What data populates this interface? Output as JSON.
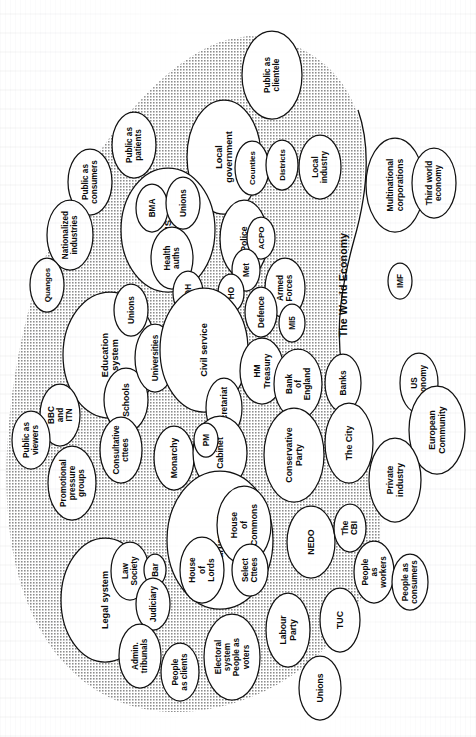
{
  "diagram": {
    "orientation": "page rotated 90 degrees; all labels read bottom-to-top",
    "colors": {
      "page_background": "#ffffff",
      "blob_fill": "#c9c9c9",
      "node_fill": "#ffffff",
      "stroke": "#111111",
      "text": "#0a0a0a"
    },
    "outer_region_label": "The World Economy",
    "nodes": [
      {
        "id": "public-as-clientele",
        "label": "Public as\nclientele",
        "cx": 272,
        "cy": 75,
        "rx": 30,
        "ry": 44,
        "fs": 8.2
      },
      {
        "id": "local-government",
        "label": "Local\ngovernment",
        "cx": 224,
        "cy": 157,
        "rx": 37,
        "ry": 57,
        "fs": 9.0
      },
      {
        "id": "counties",
        "label": "Counties",
        "cx": 252,
        "cy": 168,
        "rx": 17,
        "ry": 27,
        "fs": 7.9
      },
      {
        "id": "districts",
        "label": "Districts",
        "cx": 282,
        "cy": 165,
        "rx": 16,
        "ry": 25,
        "fs": 7.9
      },
      {
        "id": "local-industry",
        "label": "Local\nindustry",
        "cx": 320,
        "cy": 167,
        "rx": 21,
        "ry": 32,
        "fs": 8.2
      },
      {
        "id": "multinational-corporations",
        "label": "Multinational\ncorporations",
        "cx": 395,
        "cy": 185,
        "rx": 29,
        "ry": 47,
        "fs": 8.6
      },
      {
        "id": "third-world-economy",
        "label": "Third world\neconomy",
        "cx": 434,
        "cy": 183,
        "rx": 22,
        "ry": 35,
        "fs": 8.2
      },
      {
        "id": "public-as-patients",
        "label": "Public as\npatients",
        "cx": 134,
        "cy": 145,
        "rx": 22,
        "ry": 33,
        "fs": 8.2
      },
      {
        "id": "public-as-consumers-top",
        "label": "Public as\nconsumers",
        "cx": 90,
        "cy": 182,
        "rx": 22,
        "ry": 33,
        "fs": 8.2
      },
      {
        "id": "nationalized-industries",
        "label": "Nationalized\nindustries",
        "cx": 70,
        "cy": 235,
        "rx": 23,
        "ry": 35,
        "fs": 8.2
      },
      {
        "id": "quangos",
        "label": "Quangos",
        "cx": 47,
        "cy": 285,
        "rx": 17,
        "ry": 27,
        "fs": 8.0
      },
      {
        "id": "nhs",
        "label": "NHS",
        "cx": 168,
        "cy": 230,
        "rx": 47,
        "ry": 62,
        "fs": 9.5
      },
      {
        "id": "bma",
        "label": "BMA",
        "cx": 152,
        "cy": 208,
        "rx": 16,
        "ry": 24,
        "fs": 8.2
      },
      {
        "id": "unions-nhs",
        "label": "Unions",
        "cx": 183,
        "cy": 203,
        "rx": 17,
        "ry": 26,
        "fs": 8.2
      },
      {
        "id": "health-auths",
        "label": "Health\nauths",
        "cx": 172,
        "cy": 258,
        "rx": 21,
        "ry": 31,
        "fs": 8.2
      },
      {
        "id": "doh",
        "label": "DOH",
        "cx": 188,
        "cy": 293,
        "rx": 15,
        "ry": 22,
        "fs": 8.2
      },
      {
        "id": "police",
        "label": "Police",
        "cx": 244,
        "cy": 239,
        "rx": 24,
        "ry": 39,
        "fs": 8.6
      },
      {
        "id": "acpo",
        "label": "ACPO",
        "cx": 261,
        "cy": 238,
        "rx": 14,
        "ry": 21,
        "fs": 8.0
      },
      {
        "id": "met",
        "label": "Met",
        "cx": 246,
        "cy": 270,
        "rx": 14,
        "ry": 21,
        "fs": 8.2
      },
      {
        "id": "ho",
        "label": "HO",
        "cx": 231,
        "cy": 293,
        "rx": 13,
        "ry": 19,
        "fs": 8.2
      },
      {
        "id": "armed-forces",
        "label": "Armed\nForces",
        "cx": 285,
        "cy": 288,
        "rx": 20,
        "ry": 30,
        "fs": 8.2
      },
      {
        "id": "defence",
        "label": "Defence",
        "cx": 261,
        "cy": 312,
        "rx": 16,
        "ry": 25,
        "fs": 8.2
      },
      {
        "id": "mi5",
        "label": "MI5",
        "cx": 292,
        "cy": 323,
        "rx": 13,
        "ry": 19,
        "fs": 8.2
      },
      {
        "id": "education-system",
        "label": "Education\nsystem",
        "cx": 110,
        "cy": 355,
        "rx": 47,
        "ry": 63,
        "fs": 9.2
      },
      {
        "id": "unions-education",
        "label": "Unions",
        "cx": 131,
        "cy": 310,
        "rx": 17,
        "ry": 26,
        "fs": 8.2
      },
      {
        "id": "schools",
        "label": "Schools",
        "cx": 126,
        "cy": 400,
        "rx": 22,
        "ry": 32,
        "fs": 8.6
      },
      {
        "id": "universities",
        "label": "Universities",
        "cx": 155,
        "cy": 358,
        "rx": 20,
        "ry": 34,
        "fs": 8.2
      },
      {
        "id": "des",
        "label": "DES",
        "cx": 177,
        "cy": 364,
        "rx": 14,
        "ry": 21,
        "fs": 8.2
      },
      {
        "id": "civil-service",
        "label": "Civil service",
        "cx": 204,
        "cy": 350,
        "rx": 44,
        "ry": 62,
        "fs": 9.2
      },
      {
        "id": "hm-treasury",
        "label": "HM\nTreasury",
        "cx": 262,
        "cy": 371,
        "rx": 22,
        "ry": 33,
        "fs": 8.4
      },
      {
        "id": "bank-of-england",
        "label": "Bank\nof\nEngland",
        "cx": 298,
        "cy": 384,
        "rx": 24,
        "ry": 35,
        "fs": 8.2
      },
      {
        "id": "banks",
        "label": "Banks",
        "cx": 343,
        "cy": 383,
        "rx": 18,
        "ry": 29,
        "fs": 8.4
      },
      {
        "id": "us-economy",
        "label": "US\neconomy",
        "cx": 419,
        "cy": 383,
        "rx": 19,
        "ry": 30,
        "fs": 8.2
      },
      {
        "id": "european-community",
        "label": "European\nCommunity",
        "cx": 437,
        "cy": 430,
        "rx": 28,
        "ry": 44,
        "fs": 8.6
      },
      {
        "id": "secretariat",
        "label": "Secretariat",
        "cx": 224,
        "cy": 408,
        "rx": 18,
        "ry": 30,
        "fs": 8.2
      },
      {
        "id": "bbc-and-itn",
        "label": "BBC\nand\nITN",
        "cx": 60,
        "cy": 415,
        "rx": 20,
        "ry": 31,
        "fs": 8.2
      },
      {
        "id": "public-as-viewers",
        "label": "Public as\nviewers",
        "cx": 31,
        "cy": 440,
        "rx": 19,
        "ry": 29,
        "fs": 8.2
      },
      {
        "id": "promotional-pressure-groups",
        "label": "Promotional\npressure\ngroups",
        "cx": 72,
        "cy": 483,
        "rx": 24,
        "ry": 37,
        "fs": 8.2
      },
      {
        "id": "consultative-cttees",
        "label": "Consultative\ncttees",
        "cx": 121,
        "cy": 450,
        "rx": 21,
        "ry": 33,
        "fs": 8.2
      },
      {
        "id": "monarchy",
        "label": "Monarchy",
        "cx": 174,
        "cy": 458,
        "rx": 20,
        "ry": 32,
        "fs": 8.6
      },
      {
        "id": "cabinet",
        "label": "Cabinet",
        "cx": 220,
        "cy": 453,
        "rx": 27,
        "ry": 37,
        "fs": 8.6
      },
      {
        "id": "pm",
        "label": "PM",
        "cx": 206,
        "cy": 440,
        "rx": 12,
        "ry": 17,
        "fs": 8.2
      },
      {
        "id": "conservative-party",
        "label": "Conservative\nParty",
        "cx": 294,
        "cy": 455,
        "rx": 30,
        "ry": 47,
        "fs": 8.8
      },
      {
        "id": "the-city",
        "label": "The City",
        "cx": 349,
        "cy": 443,
        "rx": 24,
        "ry": 40,
        "fs": 8.8
      },
      {
        "id": "private-industry",
        "label": "Private\nindustry",
        "cx": 395,
        "cy": 480,
        "rx": 26,
        "ry": 42,
        "fs": 8.6
      },
      {
        "id": "parliament",
        "label": "Parliament",
        "cx": 220,
        "cy": 540,
        "rx": 53,
        "ry": 69,
        "fs": 9.5
      },
      {
        "id": "house-of-commons",
        "label": "House\nof\nCommons",
        "cx": 244,
        "cy": 525,
        "rx": 27,
        "ry": 39,
        "fs": 8.6
      },
      {
        "id": "select-cttees",
        "label": "Select\nCttees",
        "cx": 250,
        "cy": 570,
        "rx": 18,
        "ry": 26,
        "fs": 8.2
      },
      {
        "id": "house-of-lords",
        "label": "House\nof\nLords",
        "cx": 202,
        "cy": 570,
        "rx": 22,
        "ry": 33,
        "fs": 8.4
      },
      {
        "id": "nedo",
        "label": "NEDO",
        "cx": 311,
        "cy": 542,
        "rx": 24,
        "ry": 36,
        "fs": 8.8
      },
      {
        "id": "the-cbi",
        "label": "The\nCBI",
        "cx": 350,
        "cy": 528,
        "rx": 16,
        "ry": 24,
        "fs": 8.2
      },
      {
        "id": "people-as-workers",
        "label": "People\nas\nworkers",
        "cx": 374,
        "cy": 572,
        "rx": 20,
        "ry": 31,
        "fs": 8.2
      },
      {
        "id": "people-as-consumers",
        "label": "People as\nconsumers",
        "cx": 410,
        "cy": 582,
        "rx": 18,
        "ry": 28,
        "fs": 8.2
      },
      {
        "id": "legal-system",
        "label": "Legal system",
        "cx": 105,
        "cy": 600,
        "rx": 44,
        "ry": 62,
        "fs": 9.2
      },
      {
        "id": "law-society",
        "label": "Law\nSociety",
        "cx": 130,
        "cy": 571,
        "rx": 19,
        "ry": 29,
        "fs": 8.2
      },
      {
        "id": "bar",
        "label": "Bar",
        "cx": 155,
        "cy": 570,
        "rx": 11,
        "ry": 16,
        "fs": 8.2
      },
      {
        "id": "judiciary",
        "label": "Judiciary",
        "cx": 153,
        "cy": 604,
        "rx": 17,
        "ry": 26,
        "fs": 8.2
      },
      {
        "id": "admin-tribunals",
        "label": "Admin.\ntribunals",
        "cx": 140,
        "cy": 656,
        "rx": 21,
        "ry": 32,
        "fs": 8.2
      },
      {
        "id": "people-as-clients",
        "label": "People\nas clients",
        "cx": 180,
        "cy": 672,
        "rx": 19,
        "ry": 29,
        "fs": 8.2
      },
      {
        "id": "electoral-system-people-as-voters",
        "label": "Electoral\nsystem\nPeople as\nvoters",
        "cx": 232,
        "cy": 657,
        "rx": 28,
        "ry": 43,
        "fs": 8.2
      },
      {
        "id": "labour-party",
        "label": "Labour\nParty",
        "cx": 288,
        "cy": 630,
        "rx": 22,
        "ry": 37,
        "fs": 8.6
      },
      {
        "id": "tuc",
        "label": "TUC",
        "cx": 340,
        "cy": 620,
        "rx": 20,
        "ry": 32,
        "fs": 8.8
      },
      {
        "id": "unions-bottom",
        "label": "Unions",
        "cx": 320,
        "cy": 688,
        "rx": 21,
        "ry": 32,
        "fs": 8.6
      },
      {
        "id": "imf",
        "label": "IMF",
        "cx": 400,
        "cy": 281,
        "rx": 12,
        "ry": 18,
        "fs": 8.2
      }
    ]
  }
}
